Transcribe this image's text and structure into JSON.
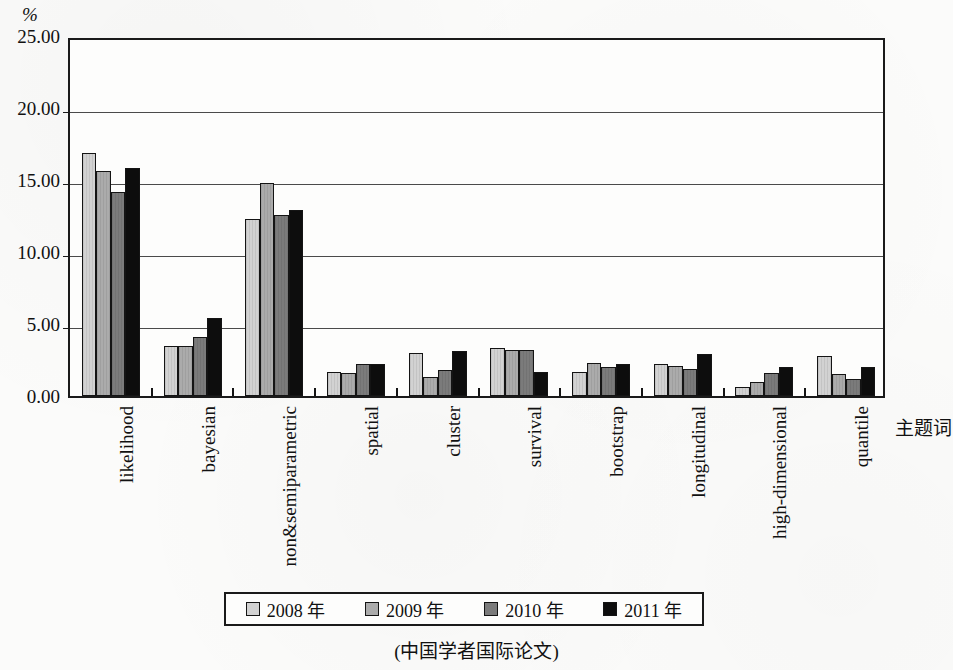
{
  "figure": {
    "y_unit": "%",
    "x_axis_title": "主题词",
    "caption": "(中国学者国际论文)"
  },
  "legend": {
    "items": [
      {
        "label": "2008 年",
        "color": "#d2d2d2"
      },
      {
        "label": "2009 年",
        "color": "#ababab"
      },
      {
        "label": "2010 年",
        "color": "#7b7b7b"
      },
      {
        "label": "2011 年",
        "color": "#0d0d0d"
      }
    ]
  },
  "chart_data": {
    "type": "bar",
    "title": "",
    "subtitle": "(中国学者国际论文)",
    "xlabel": "主题词",
    "ylabel": "%",
    "ylim": [
      0,
      25
    ],
    "yticks": [
      "0.00",
      "5.00",
      "10.00",
      "15.00",
      "20.00",
      "25.00"
    ],
    "ytick_values": [
      0,
      5,
      10,
      15,
      20,
      25
    ],
    "grid": true,
    "legend_position": "bottom",
    "categories": [
      "likelihood",
      "bayesian",
      "non&semiparametric",
      "spatial",
      "cluster",
      "survival",
      "bootstrap",
      "longitudinal",
      "high-dimensional",
      "quantile"
    ],
    "series": [
      {
        "name": "2008 年",
        "color": "#d2d2d2",
        "values": [
          16.9,
          3.5,
          12.3,
          1.7,
          3.0,
          3.3,
          1.7,
          2.2,
          0.6,
          2.8
        ]
      },
      {
        "name": "2009 年",
        "color": "#ababab",
        "values": [
          15.6,
          3.5,
          14.8,
          1.6,
          1.3,
          3.2,
          2.3,
          2.1,
          1.0,
          1.5
        ]
      },
      {
        "name": "2010 年",
        "color": "#7b7b7b",
        "values": [
          14.2,
          4.1,
          12.6,
          2.2,
          1.8,
          3.2,
          2.0,
          1.9,
          1.6,
          1.2
        ]
      },
      {
        "name": "2011 年",
        "color": "#0d0d0d",
        "values": [
          15.8,
          5.4,
          12.9,
          2.2,
          3.1,
          1.7,
          2.2,
          2.9,
          2.0,
          2.0
        ]
      }
    ]
  }
}
